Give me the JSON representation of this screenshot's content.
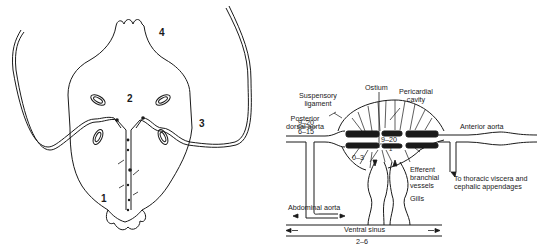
{
  "left_figure": {
    "region_labels": [
      {
        "id": "1",
        "text": "1"
      },
      {
        "id": "2",
        "text": "2"
      },
      {
        "id": "3",
        "text": "3"
      },
      {
        "id": "4",
        "text": "4"
      }
    ]
  },
  "right_figure": {
    "labels": {
      "suspensory_ligament": "Suspensory\nligament",
      "suspensory_line1": "Suspensory",
      "suspensory_line2": "ligament",
      "ostium": "Ostium",
      "pericardial_line1": "Pericardial",
      "pericardial_line2": "cavity",
      "posterior_line1": "Posterior",
      "posterior_line2": "dorsal aorta",
      "anterior_aorta": "Anterior aorta",
      "efferent_line1": "Efferent",
      "efferent_line2": "branchial",
      "efferent_line3": "vessels",
      "gills": "Gills",
      "thoracic_line1": "To thoracic viscera and",
      "thoracic_line2": "cephalic appendages",
      "abdominal_aorta": "Abdominal aorta",
      "ventral_sinus": "Ventral sinus"
    },
    "pressure_values": {
      "posterior_upper": "9–20",
      "posterior_lower": "6–15",
      "heart_center_upper": "9–20",
      "heart_center_lower": "1",
      "pericardial_range": "0–3",
      "ventral_sinus": "2–6"
    }
  }
}
